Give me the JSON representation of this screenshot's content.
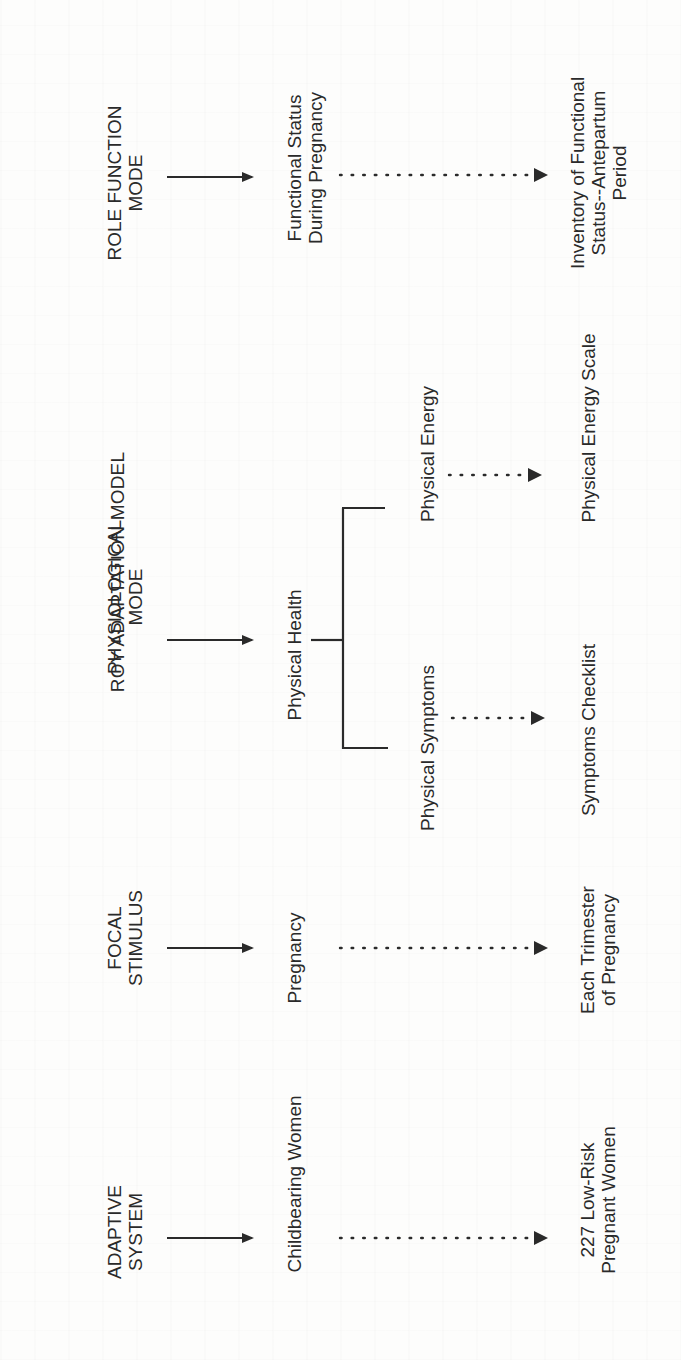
{
  "diagram": {
    "title": "ROY ADAPTATION MODEL",
    "concepts": {
      "role_function_mode": [
        "ROLE FUNCTION",
        "MODE"
      ],
      "physiological_mode": [
        "PHYSIOLOGICAL",
        "MODE"
      ],
      "focal_stimulus": [
        "FOCAL",
        "STIMULUS"
      ],
      "adaptive_system": [
        "ADAPTIVE",
        "SYSTEM"
      ]
    },
    "constructs": {
      "functional_status": [
        "Functional Status",
        "During Pregnancy"
      ],
      "physical_health": "Physical Health",
      "pregnancy": "Pregnancy",
      "childbearing_women": "Childbearing Women"
    },
    "sub_constructs": {
      "physical_energy": "Physical Energy",
      "physical_symptoms": "Physical Symptoms"
    },
    "empirical_indicators": {
      "inventory": [
        "Inventory of Functional",
        "Status--Antepartum",
        "Period"
      ],
      "physical_energy_scale": "Physical Energy Scale",
      "symptoms_checklist": "Symptoms Checklist",
      "each_trimester": [
        "Each Trimester",
        "of Pregnancy"
      ],
      "sample": [
        "227 Low-Risk",
        "Pregnant Women"
      ]
    },
    "colors": {
      "ink": "#2a2a2a",
      "background": "#fdfdfc"
    }
  }
}
